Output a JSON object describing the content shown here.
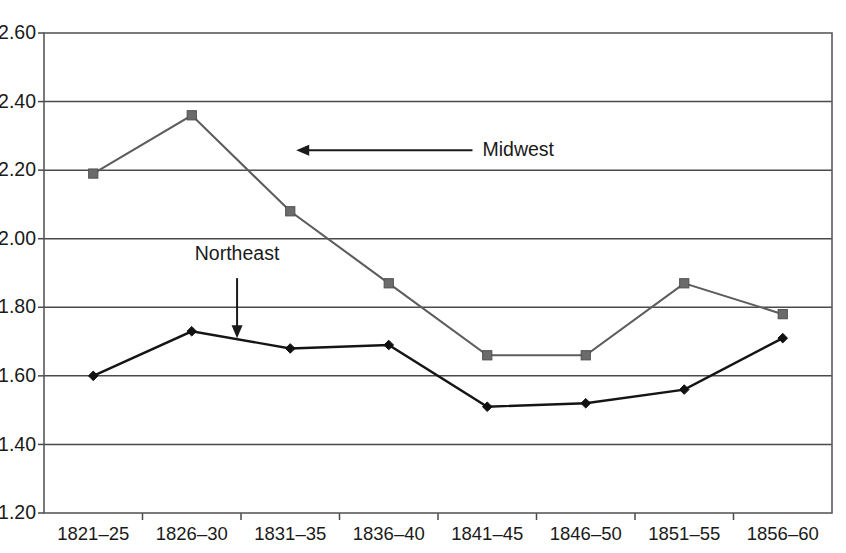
{
  "chart_data": {
    "type": "line",
    "title": "",
    "subtitle": "",
    "xlabel": "",
    "ylabel": "",
    "categories": [
      "1821–25",
      "1826–30",
      "1831–35",
      "1836–40",
      "1841–45",
      "1846–50",
      "1851–55",
      "1856–60"
    ],
    "series": [
      {
        "name": "Midwest",
        "marker": "square",
        "color": "#6b6b6b",
        "values": [
          2.19,
          2.36,
          2.08,
          1.87,
          1.66,
          1.66,
          1.87,
          1.78
        ]
      },
      {
        "name": "Northeast",
        "marker": "diamond",
        "color": "#111111",
        "values": [
          1.6,
          1.73,
          1.68,
          1.69,
          1.51,
          1.52,
          1.56,
          1.71
        ]
      }
    ],
    "ylim": [
      1.2,
      2.6
    ],
    "ytick_values": [
      1.2,
      1.4,
      1.6,
      1.8,
      2.0,
      2.2,
      2.4,
      2.6
    ],
    "ytick_labels": [
      "1.20",
      "1.40",
      "1.60",
      "1.80",
      "2.00",
      "2.20",
      "2.40",
      "2.60"
    ],
    "grid": "horizontal",
    "legend": "none",
    "annotations": [
      {
        "text": "Midwest",
        "label_x": 3.85,
        "label_y": 2.258,
        "arrow_from_x": 3.85,
        "arrow_from_y": 2.258,
        "arrow_to_x": 2.06,
        "arrow_to_y": 2.258,
        "direction": "left"
      },
      {
        "text": "Northeast",
        "label_x": 1.46,
        "label_y": 1.93,
        "arrow_from_x": 1.46,
        "arrow_from_y": 1.885,
        "arrow_to_x": 1.46,
        "arrow_to_y": 1.71,
        "direction": "down"
      }
    ]
  },
  "annotation_labels": {
    "midwest": "Midwest",
    "northeast": "Northeast"
  }
}
